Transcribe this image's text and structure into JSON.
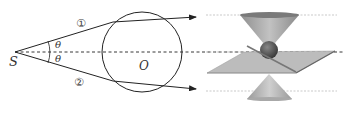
{
  "diagram": {
    "left_figure": {
      "source_label": "S",
      "center_label": "O",
      "angle_labels": [
        "θ",
        "θ"
      ],
      "ray_labels": [
        "①",
        "②"
      ]
    },
    "right_figure": {
      "description": "double cone with horizontal plane and sphere at apex"
    },
    "colors": {
      "line": "#222222",
      "cone": "#9a9a9a",
      "plane": "#b8b8b8",
      "guide": "#bdbdbd"
    }
  }
}
